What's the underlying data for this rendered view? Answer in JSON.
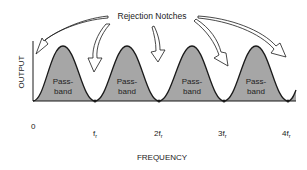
{
  "diagram": {
    "title_annotation": "Rejection Notches",
    "y_axis_label": "OUTPUT",
    "x_axis_label": "FREQUENCY",
    "x_ticks": [
      {
        "label": "0",
        "x": 33
      },
      {
        "label": "f",
        "sub": "r",
        "x": 95
      },
      {
        "label": "2f",
        "sub": "r",
        "x": 159
      },
      {
        "label": "3f",
        "sub": "r",
        "x": 224
      },
      {
        "label": "4f",
        "sub": "r",
        "x": 288
      }
    ],
    "passbands": [
      {
        "line1": "Pass-",
        "line2": "band",
        "cx": 63
      },
      {
        "line1": "Pass-",
        "line2": "band",
        "cx": 127
      },
      {
        "line1": "Pass-",
        "line2": "band",
        "cx": 192
      },
      {
        "line1": "Pass-",
        "line2": "band",
        "cx": 256
      }
    ],
    "colors": {
      "fill": "#a6a6a6",
      "stroke": "#1a1a1a",
      "background": "#ffffff"
    }
  }
}
